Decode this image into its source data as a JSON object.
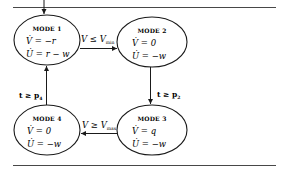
{
  "diagram": {
    "type": "state-machine",
    "colors": {
      "stroke": "#1a1a1a",
      "background": "#ffffff"
    },
    "modes": [
      {
        "id": "mode1",
        "title": "MODE 1",
        "eq_v": "V̇ = −r",
        "eq_u": "U̇ = r − w"
      },
      {
        "id": "mode2",
        "title": "MODE 2",
        "eq_v": "V̇ = 0",
        "eq_u": "U̇ = −w"
      },
      {
        "id": "mode3",
        "title": "MODE 3",
        "eq_v": "V̇ = q",
        "eq_u": "U̇ = −w"
      },
      {
        "id": "mode4",
        "title": "MODE 4",
        "eq_v": "V̇ = 0",
        "eq_u": "U̇ = −w"
      }
    ],
    "transitions": [
      {
        "from": "mode1",
        "to": "mode2",
        "label_main": "V ≤ V",
        "label_sub": "min"
      },
      {
        "from": "mode2",
        "to": "mode3",
        "label_main": "t ≥ p",
        "label_sub": "2"
      },
      {
        "from": "mode3",
        "to": "mode4",
        "label_main": "V ≥ V",
        "label_sub": "max"
      },
      {
        "from": "mode4",
        "to": "mode1",
        "label_main": "t ≥ p",
        "label_sub": "4"
      }
    ],
    "initial": {
      "to": "mode1"
    }
  }
}
